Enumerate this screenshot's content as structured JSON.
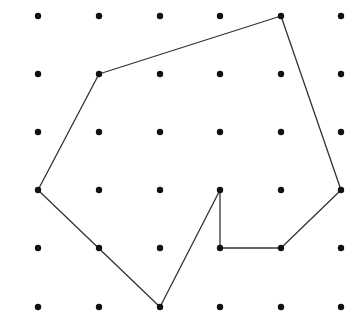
{
  "grid": {
    "columns": 6,
    "rows": 6,
    "x_positions": [
      38,
      99,
      160,
      220,
      281,
      341
    ],
    "y_positions": [
      16,
      74,
      132,
      190,
      248,
      307
    ],
    "dot_radius": 3.2,
    "dot_color": "#111111"
  },
  "polygon": {
    "stroke_color": "#333333",
    "stroke_width": 1.3,
    "vertices": [
      {
        "col": 4,
        "row": 0
      },
      {
        "col": 5,
        "row": 3
      },
      {
        "col": 4,
        "row": 4
      },
      {
        "col": 3,
        "row": 4
      },
      {
        "col": 3,
        "row": 3
      },
      {
        "col": 2,
        "row": 5
      },
      {
        "col": 0,
        "row": 3
      },
      {
        "col": 1,
        "row": 1
      }
    ]
  }
}
